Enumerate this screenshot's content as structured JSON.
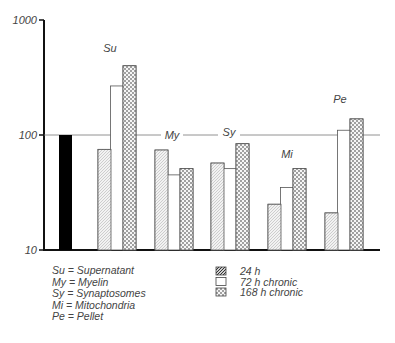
{
  "chart_data": {
    "type": "bar",
    "title": "",
    "xlabel": "",
    "ylabel": "",
    "yscale": "log",
    "ylim": [
      10,
      1000
    ],
    "yticks": [
      10,
      100,
      1000
    ],
    "ytick_labels": [
      "10",
      "100",
      "1000"
    ],
    "reference_line": 100,
    "control": {
      "name": "Control",
      "value": 100,
      "color": "#000000"
    },
    "categories": [
      "Su",
      "My",
      "Sy",
      "Mi",
      "Pe"
    ],
    "series": [
      {
        "name": "24 h",
        "pattern": "hatched",
        "values": [
          75,
          74,
          57,
          25,
          21
        ]
      },
      {
        "name": "72 h chronic",
        "pattern": "open",
        "values": [
          267,
          45,
          51,
          35,
          110
        ]
      },
      {
        "name": "168 h chronic",
        "pattern": "dotted",
        "values": [
          400,
          51,
          84,
          51,
          138
        ]
      }
    ],
    "category_legend": [
      {
        "abbr": "Su",
        "name": "Supernatant"
      },
      {
        "abbr": "My",
        "name": "Myelin"
      },
      {
        "abbr": "Sy",
        "name": "Synaptosomes"
      },
      {
        "abbr": "Mi",
        "name": "Mitochondria"
      },
      {
        "abbr": "Pe",
        "name": "Pellet"
      }
    ],
    "grid": false,
    "legend_position": "bottom"
  },
  "legend": {
    "categories": [
      {
        "text": "Su  =  Supernatant"
      },
      {
        "text": "My  =  Myelin"
      },
      {
        "text": "Sy   =  Synaptosomes"
      },
      {
        "text": "Mi   =  Mitochondria"
      },
      {
        "text": "Pe   =  Pellet"
      }
    ],
    "series": [
      {
        "text": "24  h"
      },
      {
        "text": "72  h  chronic"
      },
      {
        "text": "168  h  chronic"
      }
    ]
  }
}
